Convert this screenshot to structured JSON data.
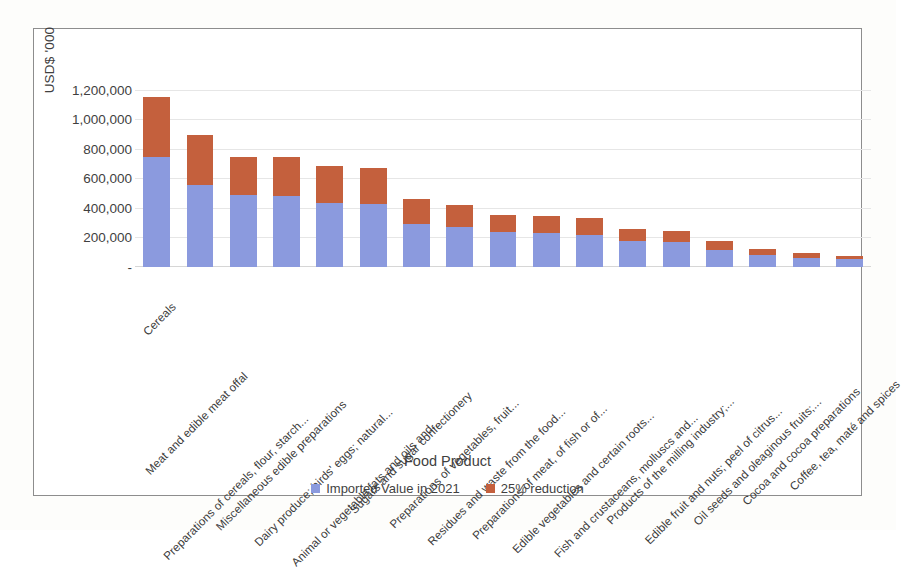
{
  "chart_data": {
    "type": "bar",
    "subtype": "stacked-column",
    "title": "",
    "xlabel": "Food Product",
    "ylabel": "USD$ '000",
    "ylim": [
      0,
      1300000
    ],
    "grid": true,
    "legend_position": "bottom",
    "y_ticks": [
      "-",
      "200,000",
      "400,000",
      "600,000",
      "800,000",
      "1,000,000",
      "1,200,000"
    ],
    "y_tick_values": [
      0,
      200000,
      400000,
      600000,
      800000,
      1000000,
      1200000
    ],
    "categories": [
      "Cereals",
      "Meat and edible meat offal",
      "Preparations of cereals, flour, starch...",
      "Miscellaneous edible preparations",
      "Dairy produce; birds' eggs; natural...",
      "Animal or vegetable fats and oils and...",
      "Sugars and sugar confectionery",
      "Preparations of vegetables, fruit...",
      "Residues and waste from the food...",
      "Preparations of meat, of fish or of...",
      "Edible vegetables and certain roots...",
      "Fish and crustaceans, molluscs and...",
      "Products of the milling industry;...",
      "Edible fruit and nuts; peel of citrus...",
      "Oil seeds and oleaginous fruits;...",
      "Cocoa and cocoa preparations",
      "Coffee, tea, maté and spices"
    ],
    "series": [
      {
        "name": "Imported Value in 2021",
        "color": "#8b9ade",
        "values": [
          746000,
          558000,
          487000,
          480000,
          436000,
          428000,
          292000,
          272000,
          240000,
          233000,
          214000,
          178000,
          168000,
          118000,
          82000,
          62000,
          52000
        ]
      },
      {
        "name": "25% reduction",
        "color": "#c4603d",
        "values": [
          402000,
          337000,
          259000,
          265000,
          246000,
          242000,
          168000,
          148000,
          110000,
          110000,
          116000,
          80000,
          77000,
          55000,
          39000,
          30000,
          24000
        ]
      }
    ],
    "totals": [
      1148000,
      895000,
      746000,
      745000,
      682000,
      670000,
      460000,
      420000,
      350000,
      343000,
      330000,
      258000,
      245000,
      173000,
      121000,
      92000,
      76000
    ]
  },
  "legend": {
    "items": [
      {
        "label": "Imported Value in 2021",
        "color": "#8b9ade"
      },
      {
        "label": "25% reduction",
        "color": "#c4603d"
      }
    ]
  }
}
